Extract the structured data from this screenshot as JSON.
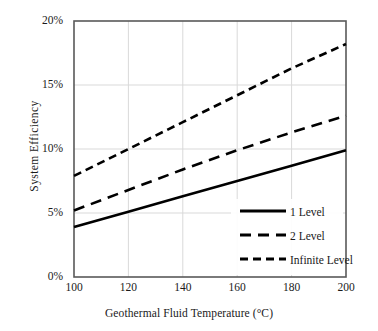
{
  "chart_data": {
    "type": "line",
    "title": "",
    "xlabel": "Geothermal Fluid Temperature (°C)",
    "ylabel": "System  Efficiency",
    "xlim": [
      100,
      200
    ],
    "ylim": [
      0,
      20
    ],
    "xticks": [
      "100",
      "120",
      "140",
      "160",
      "180",
      "200"
    ],
    "xtick_values": [
      100,
      120,
      140,
      160,
      180,
      200
    ],
    "yticks": [
      "0%",
      "5%",
      "10%",
      "15%",
      "20%"
    ],
    "ytick_values": [
      0,
      5,
      10,
      15,
      20
    ],
    "grid": true,
    "grid_axis": "both",
    "legend_position": "lower right",
    "x": [
      100,
      120,
      140,
      160,
      180,
      200
    ],
    "series": [
      {
        "name": "1 Level",
        "label": "1 Level",
        "style": "solid",
        "color": "#000000",
        "values": [
          3.9,
          5.1,
          6.3,
          7.5,
          8.7,
          9.9
        ]
      },
      {
        "name": "2 Level",
        "label": "2 Level",
        "style": "long-dash",
        "color": "#000000",
        "values": [
          5.2,
          6.8,
          8.4,
          9.9,
          11.3,
          12.6
        ]
      },
      {
        "name": "Infinite Level",
        "label": "Infinite Level",
        "style": "dash",
        "color": "#000000",
        "values": [
          7.9,
          10.0,
          12.1,
          14.2,
          16.3,
          18.2
        ]
      }
    ]
  },
  "axes": {
    "x_title": "Geothermal Fluid Temperature (°C)",
    "y_title": "System  Efficiency"
  },
  "ytick_labels": {
    "t0": "0%",
    "t1": "5%",
    "t2": "10%",
    "t3": "15%",
    "t4": "20%"
  },
  "xtick_labels": {
    "t0": "100",
    "t1": "120",
    "t2": "140",
    "t3": "160",
    "t4": "180",
    "t5": "200"
  },
  "legend": {
    "items": [
      {
        "label": "1 Level"
      },
      {
        "label": "2 Level"
      },
      {
        "label": "Infinite Level"
      }
    ]
  },
  "colors": {
    "line": "#000000",
    "grid": "#d9d9d9",
    "frame": "#595959",
    "background": "#ffffff"
  }
}
